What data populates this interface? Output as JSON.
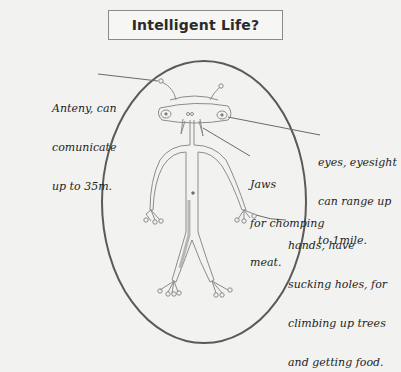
{
  "title": "Intelligent Life?",
  "annotations": [
    {
      "id": "antenna",
      "lines": [
        "Anteny, can",
        "comunicate",
        "up to 35m."
      ]
    },
    {
      "id": "eyes",
      "lines": [
        "eyes, eyesight",
        "can range up",
        "to 1mile."
      ]
    },
    {
      "id": "jaws",
      "lines": [
        "Jaws",
        "for chomping",
        "meat."
      ]
    },
    {
      "id": "hands",
      "lines": [
        "hands, have",
        "sucking holes, for",
        "climbing up trees",
        "and getting food."
      ]
    }
  ],
  "colors": {
    "paper": "#f2f2f0",
    "outline": "#5a5a5a",
    "sketch": "#8c8c8c",
    "ink": "#1e1e1e"
  }
}
